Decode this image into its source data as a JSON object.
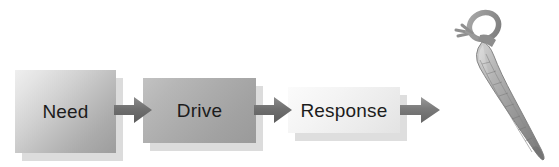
{
  "diagram": {
    "background_color": "#ffffff",
    "nodes": [
      {
        "id": "need",
        "label": "Need",
        "fill_from": "#efefef",
        "fill_to": "#9d9d9d",
        "text_color": "#1c1c1c"
      },
      {
        "id": "drive",
        "label": "Drive",
        "fill_from": "#c2c2c2",
        "fill_to": "#9a9a9a",
        "text_color": "#1c1c1c"
      },
      {
        "id": "response",
        "label": "Response",
        "fill_from": "#fbfbfb",
        "fill_to": "#e3e3e3",
        "text_color": "#1c1c1c"
      }
    ],
    "connectors": [
      {
        "id": "arrow-1",
        "from": "need",
        "to": "drive",
        "direction": "right",
        "color": "#6e6e6e"
      },
      {
        "id": "arrow-2",
        "from": "drive",
        "to": "response",
        "direction": "right",
        "color": "#6e6e6e"
      },
      {
        "id": "arrow-3",
        "from": "response",
        "to": "carrot",
        "direction": "right",
        "color": "#7a7a7a"
      }
    ],
    "illustration": {
      "id": "carrot",
      "name": "carrot",
      "description": "grayscale carrot with looped stem, tilted diagonally",
      "body_color": "#9e9e9e",
      "stem_color": "#8a8a8a"
    },
    "shadow_color": "#dcdcdc"
  }
}
